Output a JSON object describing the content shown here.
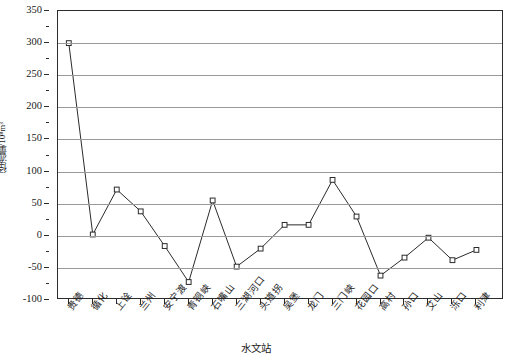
{
  "chart_data": {
    "type": "line",
    "title": "",
    "xlabel": "水文站",
    "ylabel": "径流量/10⁸m³",
    "ylim": [
      -100,
      350
    ],
    "ytick_step": 50,
    "yticks": [
      350,
      300,
      250,
      200,
      150,
      100,
      50,
      0,
      -50,
      -100
    ],
    "ytick_labels": [
      "350",
      "300",
      "250",
      "200",
      "150",
      "100",
      "50",
      "0",
      "-50",
      "-100"
    ],
    "grid": true,
    "grid_axis": "y",
    "legend": "none",
    "marker": "open-square",
    "line_color": "#2b2b2b",
    "marker_color": "#2b2b2b",
    "grid_color": "#9a9a9a",
    "categories": [
      "贵德",
      "循化",
      "上诠",
      "兰州",
      "安宁渡",
      "青铜峡",
      "石嘴山",
      "三湖河口",
      "头道拐",
      "吴堡",
      "龙门",
      "三门峡",
      "花园口",
      "高村",
      "孙口",
      "艾山",
      "泺口",
      "利津"
    ],
    "values": [
      300,
      2,
      72,
      38,
      -16,
      -72,
      55,
      -48,
      -20,
      17,
      17,
      87,
      30,
      -62,
      -34,
      -3,
      -38,
      -22
    ]
  }
}
